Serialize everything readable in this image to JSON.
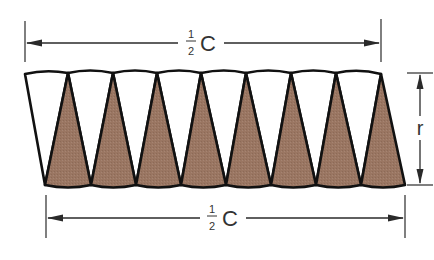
{
  "diagram": {
    "type": "sector-strip",
    "top_dimension": {
      "numerator": "1",
      "denominator": "2",
      "symbol": "C"
    },
    "bottom_dimension": {
      "numerator": "1",
      "denominator": "2",
      "symbol": "C"
    },
    "height_dimension": {
      "symbol": "r"
    },
    "colors": {
      "shaded_sector": "#9a7662",
      "unshaded_sector": "#ffffff",
      "outline": "#111111"
    },
    "sector_counts": {
      "shaded": 8,
      "unshaded": 8
    }
  }
}
